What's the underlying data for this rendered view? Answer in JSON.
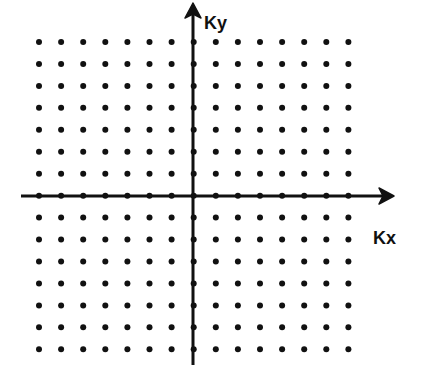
{
  "diagram": {
    "axes": {
      "x_label": "Kx",
      "y_label": "Ky",
      "color": "#111111"
    },
    "grid": {
      "columns": 15,
      "rows": 15,
      "x0": 39,
      "y0": 42,
      "spacing_x": 22.1,
      "spacing_y": 21.95,
      "dot_radius": 3,
      "dot_color": "#111111"
    }
  }
}
